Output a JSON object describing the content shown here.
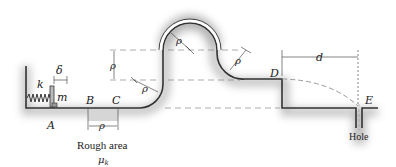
{
  "diagram": {
    "labels": {
      "A": "A",
      "B": "B",
      "C": "C",
      "D": "D",
      "E": "E",
      "k": "k",
      "m": "m",
      "delta": "δ",
      "d": "d",
      "rho": "ρ",
      "rough_area": "Rough area",
      "mu_k": "μk",
      "mu": "μ",
      "mu_sub": "k",
      "hole": "Hole"
    },
    "colors": {
      "track": "#333333",
      "shadow": "#9a9a9a",
      "rough": "#d4d4d4",
      "dash": "#888888",
      "text": "#222222"
    }
  }
}
